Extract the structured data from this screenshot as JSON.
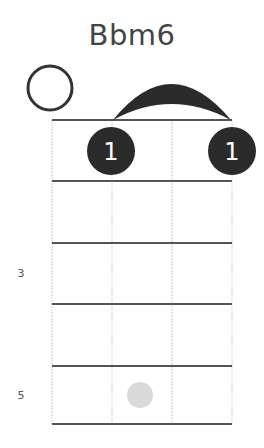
{
  "chord": {
    "name": "Bbm6",
    "open_strings": [
      0
    ],
    "barre": {
      "fret": 1,
      "from_string": 1,
      "to_string": 3,
      "finger": "1"
    },
    "fingers": [
      {
        "string": 1,
        "fret": 1,
        "label": "1"
      },
      {
        "string": 3,
        "fret": 1,
        "label": "1"
      }
    ],
    "ghost_dots": [
      {
        "string": 1,
        "fret": 5
      }
    ],
    "fret_markers": [
      {
        "fret": 3,
        "label": "3"
      },
      {
        "fret": 5,
        "label": "5"
      }
    ]
  },
  "colors": {
    "text": "#444444",
    "fret_line": "#555555",
    "string_line": "#cccccc",
    "finger_dot": "#2b2b2b",
    "finger_text": "#ffffff",
    "ghost_dot": "#d9d9d9"
  }
}
